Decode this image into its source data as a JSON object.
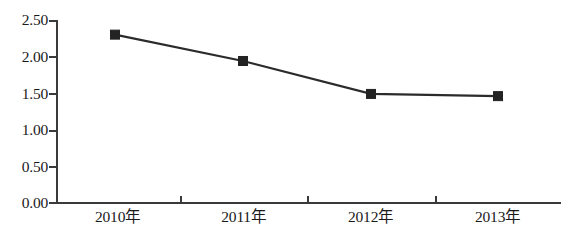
{
  "chart_data": {
    "type": "line",
    "title": "",
    "subtitle": "",
    "xlabel": "",
    "ylabel": "",
    "categories": [
      "2010年",
      "2011年",
      "2012年",
      "2013年"
    ],
    "values": [
      2.3,
      1.94,
      1.49,
      1.46
    ],
    "series": [
      {
        "name": "",
        "values": [
          2.3,
          1.94,
          1.49,
          1.46
        ],
        "marker": "square",
        "color": "#232323"
      }
    ],
    "ylim": [
      0.0,
      2.5
    ],
    "ytick_labels": [
      "0.00",
      "0.50",
      "1.00",
      "1.50",
      "2.00",
      "2.50"
    ],
    "ytick_values": [
      0.0,
      0.5,
      1.0,
      1.5,
      2.0,
      2.5
    ],
    "xtick_labels": [
      "2010年",
      "2011年",
      "2012年",
      "2013年"
    ],
    "grid": false,
    "legend": false,
    "legend_position": "none",
    "annotations": [],
    "colors": {
      "line": "#2b2b2b",
      "marker": "#232323",
      "axis": "#3a3a3a",
      "background": "#ffffff",
      "text": "#1a1a1a"
    }
  },
  "axis": {
    "y_labels": [
      {
        "text": "2.50",
        "value": 2.5
      },
      {
        "text": "2.00",
        "value": 2.0
      },
      {
        "text": "1.50",
        "value": 1.5
      },
      {
        "text": "1.00",
        "value": 1.0
      },
      {
        "text": "0.50",
        "value": 0.5
      },
      {
        "text": "0.00",
        "value": 0.0
      }
    ],
    "x_labels": [
      {
        "text": "2010年"
      },
      {
        "text": "2011年"
      },
      {
        "text": "2012年"
      },
      {
        "text": "2013年"
      }
    ]
  }
}
